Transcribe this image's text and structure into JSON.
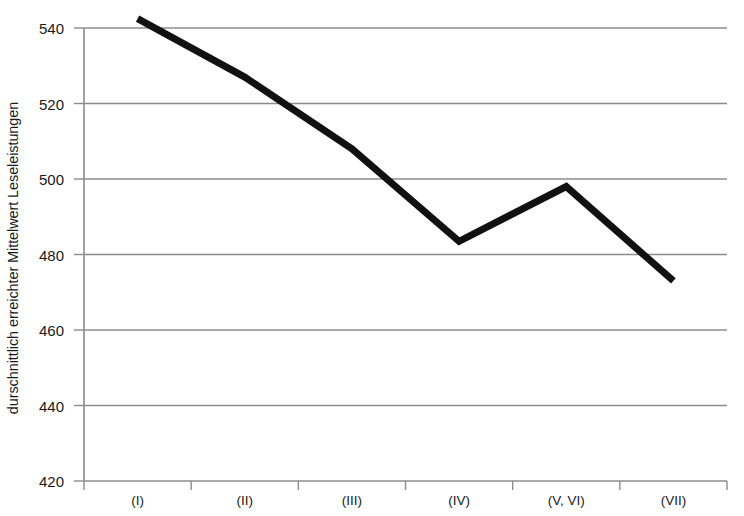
{
  "chart_data": {
    "type": "line",
    "title": "",
    "xlabel": "",
    "ylabel": "durschnittlich erreichter Mittelwert Leseleistungen",
    "categories": [
      "(I)",
      "(II)",
      "(III)",
      "(IV)",
      "(V, VI)",
      "(VII)"
    ],
    "values": [
      542.5,
      527,
      508,
      483.5,
      498,
      473
    ],
    "series": [
      {
        "name": "durschnittlich erreichter Mittelwert Leseleistungen",
        "values": [
          542.5,
          527,
          508,
          483.5,
          498,
          473
        ]
      }
    ],
    "ylim": [
      420,
      540
    ],
    "yticks": [
      420,
      440,
      460,
      480,
      500,
      520,
      540
    ],
    "ytick_labels": [
      "420",
      "440",
      "460",
      "480",
      "500",
      "520",
      "540"
    ],
    "grid": "horizontal",
    "legend": "none",
    "line_color": "#111111",
    "grid_color": "#8c8c8c",
    "axis_color": "#8c8c8c",
    "line_width": 7,
    "clipped_top": true
  },
  "axes": {
    "y_title": "durschnittlich erreichter Mittelwert Leseleistungen",
    "y_labels": [
      "540",
      "520",
      "500",
      "480",
      "460",
      "440",
      "420"
    ],
    "x_labels": [
      "(I)",
      "(II)",
      "(III)",
      "(IV)",
      "(V, VI)",
      "(VII)"
    ]
  }
}
